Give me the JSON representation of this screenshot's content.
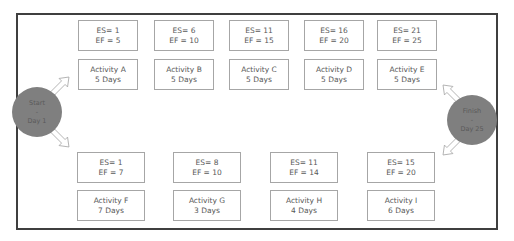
{
  "diagram": {
    "type": "network-diagram",
    "start": {
      "line1": "Start",
      "line2": "-",
      "line3": "Day 1"
    },
    "finish": {
      "line1": "Finish",
      "line2": "-",
      "line3": "Day 25"
    },
    "top_path": [
      {
        "es": "ES= 1",
        "ef": "EF = 5",
        "name": "Activity A",
        "duration": "5 Days"
      },
      {
        "es": "ES= 6",
        "ef": "EF = 10",
        "name": "Activity B",
        "duration": "5 Days"
      },
      {
        "es": "ES= 11",
        "ef": "EF = 15",
        "name": "Activity C",
        "duration": "5 Days"
      },
      {
        "es": "ES= 16",
        "ef": "EF = 20",
        "name": "Activity D",
        "duration": "5 Days"
      },
      {
        "es": "ES= 21",
        "ef": "EF = 25",
        "name": "Activity E",
        "duration": "5 Days"
      }
    ],
    "bottom_path": [
      {
        "es": "ES= 1",
        "ef": "EF = 7",
        "name": "Activity F",
        "duration": "7 Days"
      },
      {
        "es": "ES= 8",
        "ef": "EF = 10",
        "name": "Activity G",
        "duration": "3 Days"
      },
      {
        "es": "ES= 11",
        "ef": "EF = 14",
        "name": "Activity H",
        "duration": "4 Days"
      },
      {
        "es": "ES= 15",
        "ef": "EF = 20",
        "name": "Activity I",
        "duration": "6 Days"
      }
    ],
    "colors": {
      "node_fill": "#7f7f7f",
      "frame": "#3f3f3f",
      "box_border": "#a6a6a6",
      "text": "#595959"
    }
  }
}
